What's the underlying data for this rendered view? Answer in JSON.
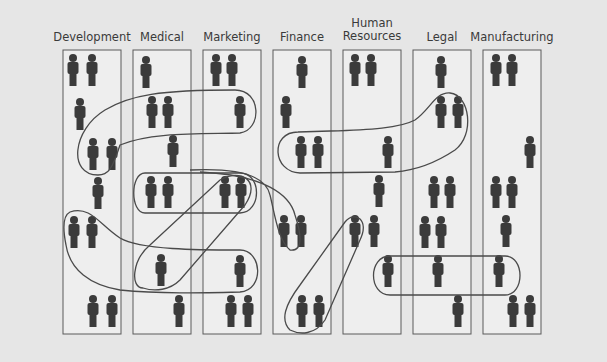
{
  "diagram": {
    "colors": {
      "background": "#e6e6e6",
      "column_fill": "#eeeeee",
      "column_stroke": "#5a5a5a",
      "person": "#3b3b3b",
      "loop_stroke": "#4a4a4a",
      "label": "#3a3a3a"
    },
    "columns": [
      {
        "label": "Development",
        "label_line2": "",
        "x": 63,
        "people": [
          [
            73,
            70
          ],
          [
            92,
            70
          ],
          [
            80,
            114
          ],
          [
            93,
            154
          ],
          [
            112,
            154
          ],
          [
            98,
            193
          ],
          [
            74,
            232
          ],
          [
            92,
            232
          ],
          [
            93,
            311
          ],
          [
            112,
            311
          ]
        ]
      },
      {
        "label": "Medical",
        "label_line2": "",
        "x": 133,
        "people": [
          [
            146,
            72
          ],
          [
            152,
            112
          ],
          [
            168,
            112
          ],
          [
            173,
            151
          ],
          [
            151,
            192
          ],
          [
            168,
            192
          ],
          [
            161,
            270
          ],
          [
            179,
            311
          ]
        ]
      },
      {
        "label": "Marketing",
        "label_line2": "",
        "x": 203,
        "people": [
          [
            216,
            70
          ],
          [
            232,
            70
          ],
          [
            240,
            112
          ],
          [
            225,
            192
          ],
          [
            241,
            192
          ],
          [
            240,
            271
          ],
          [
            231,
            311
          ],
          [
            248,
            311
          ]
        ]
      },
      {
        "label": "Finance",
        "label_line2": "",
        "x": 273,
        "people": [
          [
            302,
            72
          ],
          [
            286,
            112
          ],
          [
            301,
            152
          ],
          [
            318,
            152
          ],
          [
            284,
            231
          ],
          [
            301,
            231
          ],
          [
            302,
            311
          ],
          [
            319,
            311
          ]
        ]
      },
      {
        "label": "Human",
        "label_line2": "Resources",
        "x": 343,
        "people": [
          [
            355,
            70
          ],
          [
            371,
            70
          ],
          [
            388,
            152
          ],
          [
            379,
            191
          ],
          [
            355,
            231
          ],
          [
            374,
            231
          ],
          [
            388,
            271
          ]
        ]
      },
      {
        "label": "Legal",
        "label_line2": "",
        "x": 413,
        "people": [
          [
            441,
            72
          ],
          [
            441,
            112
          ],
          [
            458,
            112
          ],
          [
            434,
            192
          ],
          [
            450,
            192
          ],
          [
            425,
            232
          ],
          [
            441,
            232
          ],
          [
            438,
            271
          ],
          [
            458,
            311
          ]
        ]
      },
      {
        "label": "Manufacturing",
        "label_line2": "",
        "x": 483,
        "people": [
          [
            496,
            70
          ],
          [
            512,
            70
          ],
          [
            530,
            152
          ],
          [
            496,
            192
          ],
          [
            512,
            192
          ],
          [
            506,
            231
          ],
          [
            499,
            271
          ],
          [
            513,
            311
          ],
          [
            530,
            311
          ]
        ]
      }
    ],
    "column_width": 58,
    "column_top": 50,
    "column_bottom": 334,
    "loops": [
      "M 98 175 C 68 175, 72 130, 105 110 C 130 95, 160 90, 235 90 C 262 90, 262 130, 240 133 C 200 134, 150 132, 120 145 C 112 170, 108 175, 98 175 Z",
      "M 145 173 L 240 173 C 262 173, 262 212, 240 213 L 145 213 C 130 213, 130 173, 145 173 Z",
      "M 143 288 C 130 288, 132 260, 150 245 L 220 180 C 240 168, 262 180, 245 205 L 180 280 C 170 290, 155 292, 143 288 Z",
      "M 70 212 C 90 205, 100 225, 120 238 C 140 250, 200 250, 240 250 C 262 250, 265 290, 240 292 C 200 293, 160 294, 120 290 C 90 285, 70 270, 66 245 C 62 225, 64 215, 70 212 Z",
      "M 190 170 C 230 168, 265 172, 270 195 C 275 215, 278 240, 290 250 C 305 252, 300 230, 295 215 C 290 195, 265 175, 200 172",
      "M 298 132 C 270 132, 272 172, 300 173 L 395 172 C 420 170, 440 160, 455 150 C 475 135, 470 95, 450 93 C 435 92, 430 110, 415 120 C 400 128, 370 130, 330 131 Z",
      "M 290 330 C 280 320, 285 305, 300 285 L 345 222 C 355 210, 370 220, 360 240 L 325 320 C 315 335, 300 335, 290 330 Z",
      "M 390 256 L 505 256 C 525 256, 525 295, 505 295 L 390 295 C 368 295, 368 256, 390 256 Z"
    ]
  }
}
